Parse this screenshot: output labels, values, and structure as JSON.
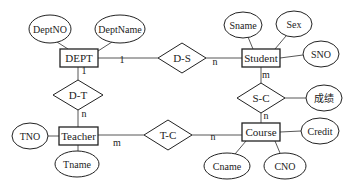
{
  "diagram": {
    "type": "ER diagram",
    "entities": [
      {
        "id": "dept",
        "label": "DEPT",
        "x": 60,
        "y": 49,
        "w": 38,
        "h": 18
      },
      {
        "id": "student",
        "label": "Student",
        "x": 242,
        "y": 49,
        "w": 38,
        "h": 18
      },
      {
        "id": "teacher",
        "label": "Teacher",
        "x": 59,
        "y": 127,
        "w": 39,
        "h": 18
      },
      {
        "id": "course",
        "label": "Course",
        "x": 242,
        "y": 123,
        "w": 38,
        "h": 18
      }
    ],
    "relationships": [
      {
        "id": "ds",
        "label": "D-S",
        "cx": 182,
        "cy": 58,
        "hw": 24,
        "hh": 15
      },
      {
        "id": "dt",
        "label": "D-T",
        "cx": 78,
        "cy": 95,
        "hw": 25,
        "hh": 15
      },
      {
        "id": "sc",
        "label": "S-C",
        "cx": 261,
        "cy": 98,
        "hw": 24,
        "hh": 15
      },
      {
        "id": "tc",
        "label": "T-C",
        "cx": 168,
        "cy": 135,
        "hw": 24,
        "hh": 15
      }
    ],
    "attributes": [
      {
        "id": "deptno",
        "label": "DeptNO",
        "cx": 50,
        "cy": 29,
        "rx": 21,
        "ry": 14
      },
      {
        "id": "deptname",
        "label": "DeptName",
        "cx": 120,
        "cy": 29,
        "rx": 25,
        "ry": 14
      },
      {
        "id": "sname",
        "label": "Sname",
        "cx": 243,
        "cy": 25,
        "rx": 19,
        "ry": 13
      },
      {
        "id": "sex",
        "label": "Sex",
        "cx": 294,
        "cy": 24,
        "rx": 18,
        "ry": 13
      },
      {
        "id": "sno",
        "label": "SNO",
        "cx": 321,
        "cy": 54,
        "rx": 18,
        "ry": 13
      },
      {
        "id": "grade",
        "label": "成绩",
        "cx": 324,
        "cy": 98,
        "rx": 18,
        "ry": 13
      },
      {
        "id": "tno",
        "label": "TNO",
        "cx": 30,
        "cy": 136,
        "rx": 18,
        "ry": 13
      },
      {
        "id": "tname",
        "label": "Tname",
        "cx": 77,
        "cy": 164,
        "rx": 22,
        "ry": 13
      },
      {
        "id": "credit",
        "label": "Credit",
        "cx": 320,
        "cy": 131,
        "rx": 19,
        "ry": 13
      },
      {
        "id": "cname",
        "label": "Cname",
        "cx": 227,
        "cy": 166,
        "rx": 23,
        "ry": 13
      },
      {
        "id": "cno",
        "label": "CNO",
        "cx": 285,
        "cy": 166,
        "rx": 21,
        "ry": 13
      }
    ],
    "cardinalities": [
      {
        "id": "dept-ds",
        "label": "1",
        "x": 122,
        "y": 63
      },
      {
        "id": "ds-student",
        "label": "n",
        "x": 215,
        "y": 65
      },
      {
        "id": "dept-dt",
        "label": "1",
        "x": 84,
        "y": 74
      },
      {
        "id": "dt-teacher",
        "label": "n",
        "x": 84,
        "y": 117
      },
      {
        "id": "student-sc",
        "label": "m",
        "x": 266,
        "y": 78
      },
      {
        "id": "sc-course",
        "label": "n",
        "x": 266,
        "y": 119
      },
      {
        "id": "teacher-tc",
        "label": "m",
        "x": 117,
        "y": 146
      },
      {
        "id": "tc-course",
        "label": "n",
        "x": 213,
        "y": 140
      }
    ]
  }
}
